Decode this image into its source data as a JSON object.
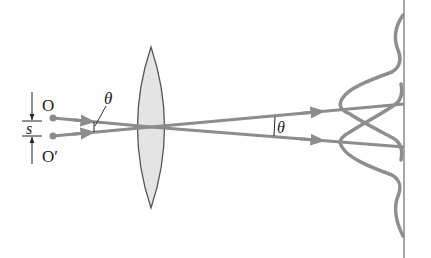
{
  "diagram": {
    "labels": {
      "object_top": "O",
      "object_bottom": "O′",
      "separation": "s",
      "angle_object_side": "θ",
      "angle_image_side": "θ"
    },
    "colors": {
      "ray": "#8c8c8c",
      "lens_fill": "#e4e4e4",
      "lens_stroke": "#555555",
      "curve": "#8e8e8e",
      "screen": "#777777",
      "text": "#1a1a1a"
    },
    "elements": [
      "point-source-O",
      "point-source-O-prime",
      "separation-dimension-s",
      "converging-lens",
      "ray-from-O",
      "ray-from-O-prime",
      "screen",
      "diffraction-pattern-O",
      "diffraction-pattern-O-prime"
    ]
  }
}
